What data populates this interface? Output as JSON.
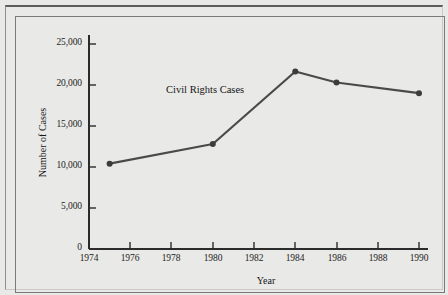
{
  "figure": {
    "background_color": "#e9e9e7",
    "frame_color": "#7a7a7a",
    "ink_color": "#2b2b2b"
  },
  "chart_data": {
    "type": "line",
    "title": "",
    "annotation": "Civil Rights Cases",
    "xlabel": "Year",
    "ylabel": "Number of Cases",
    "grid": false,
    "legend": "none",
    "series_color": "#4a4a4a",
    "x": [
      1975,
      1980,
      1984,
      1986,
      1990
    ],
    "values": [
      10400,
      12800,
      21650,
      20300,
      19000
    ],
    "series": [
      {
        "name": "Civil Rights Cases",
        "x": [
          1975,
          1980,
          1984,
          1986,
          1990
        ],
        "values": [
          10400,
          12800,
          21650,
          20300,
          19000
        ]
      }
    ],
    "xlim": [
      1974,
      1990
    ],
    "ylim": [
      0,
      25000
    ],
    "xticks": [
      1974,
      1976,
      1978,
      1980,
      1982,
      1984,
      1986,
      1988,
      1990
    ],
    "xtick_labels": [
      "1974",
      "1976",
      "1978",
      "1980",
      "1982",
      "1984",
      "1986",
      "1988",
      "1990"
    ],
    "yticks": [
      0,
      5000,
      10000,
      15000,
      20000,
      25000
    ],
    "ytick_labels": [
      "0",
      "5,000",
      "10,000",
      "15,000",
      "20,000",
      "25,000"
    ]
  }
}
